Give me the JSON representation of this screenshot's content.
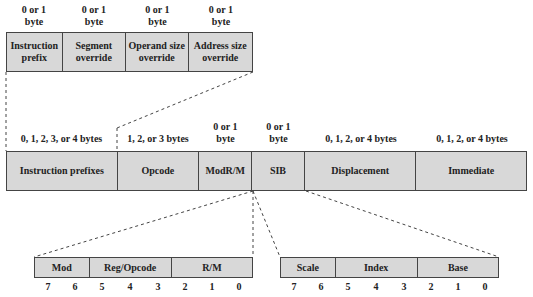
{
  "prefix_fields": [
    {
      "size": "0 or 1\nbyte",
      "name": "Instruction prefix"
    },
    {
      "size": "0 or 1\nbyte",
      "name": "Segment override"
    },
    {
      "size": "0 or 1\nbyte",
      "name": "Operand size override"
    },
    {
      "size": "0 or 1\nbyte",
      "name": "Address size override"
    }
  ],
  "instruction_fields": [
    {
      "size": "0, 1, 2, 3, or 4 bytes",
      "name": "Instruction prefixes"
    },
    {
      "size": "1, 2, or 3 bytes",
      "name": "Opcode"
    },
    {
      "size": "0 or 1 byte",
      "name": "ModR/M"
    },
    {
      "size": "0 or 1 byte",
      "name": "SIB"
    },
    {
      "size": "0, 1, 2, or 4 bytes",
      "name": "Displacement"
    },
    {
      "size": "0, 1, 2, or 4 bytes",
      "name": "Immediate"
    }
  ],
  "modrm_fields": [
    "Mod",
    "Reg/Opcode",
    "R/M"
  ],
  "sib_fields": [
    "Scale",
    "Index",
    "Base"
  ],
  "bits": [
    "7",
    "6",
    "5",
    "4",
    "3",
    "2",
    "1",
    "0"
  ],
  "colors": {
    "fill": "#d8d8d8",
    "border": "#444444"
  }
}
